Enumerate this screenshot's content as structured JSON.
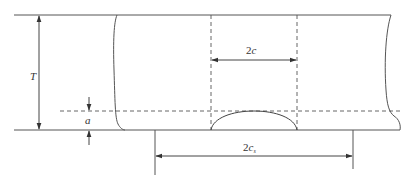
{
  "diagram": {
    "title": "",
    "colors": {
      "line": "#4a4a4a",
      "background": "#ffffff"
    },
    "labels": {
      "thickness": "T",
      "crack_depth": "a",
      "crack_length_prefix": "2",
      "crack_length_var": "c",
      "surface_length_prefix": "2",
      "surface_length_var": "c",
      "surface_length_sub": "s"
    },
    "elements": [
      {
        "id": "plate-top-surface",
        "type": "solid-line"
      },
      {
        "id": "plate-bottom-surface",
        "type": "solid-line"
      },
      {
        "id": "crack-depth-reference",
        "type": "dashed-line"
      },
      {
        "id": "crack-profile",
        "type": "semi-ellipse"
      },
      {
        "id": "thickness-dimension",
        "label": "T"
      },
      {
        "id": "crack-length-dimension",
        "label": "2c"
      },
      {
        "id": "crack-depth-dimension",
        "label": "a"
      },
      {
        "id": "surface-length-dimension",
        "label": "2c_s"
      }
    ]
  }
}
